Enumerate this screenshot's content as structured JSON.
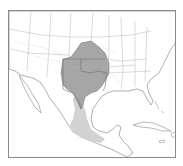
{
  "map": {
    "region": "United States, Mexico and Central America",
    "colors": {
      "background": "#ffffff",
      "frame": "#8a8a8a",
      "land_outline": "#9a9a9a",
      "state_borders": "#b5b5b5",
      "rivers": "#c8c8c8",
      "primary_range": "#a6a6a6",
      "primary_range_border": "#6e6e6e",
      "secondary_range": "#d2d2d2"
    },
    "layers": [
      {
        "name": "primary-range",
        "description": "darker shaded range: Kansas, Oklahoma, Texas, western Arkansas/Missouri"
      },
      {
        "name": "secondary-range",
        "description": "lighter shaded range: eastern Mexico from Tamaulipas south to Oaxaca"
      },
      {
        "name": "state-borders"
      },
      {
        "name": "coastlines"
      },
      {
        "name": "rivers"
      }
    ]
  }
}
